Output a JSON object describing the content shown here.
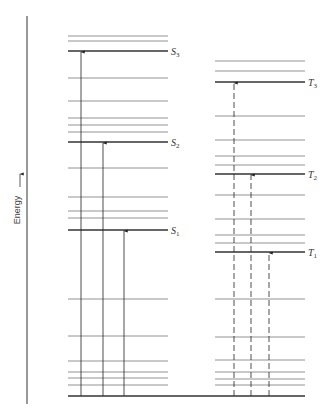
{
  "axis": {
    "label": "Energy",
    "direction": "up",
    "x": 27,
    "y_top": 16,
    "y_bottom": 404
  },
  "ground_state": {
    "y": 396,
    "x1": 68,
    "x2": 305
  },
  "singlet": {
    "x1": 68,
    "x2": 168,
    "levels_minor": [
      36,
      41,
      78,
      101,
      118,
      125,
      132,
      168,
      197,
      211,
      218,
      299,
      336,
      361,
      372,
      378,
      385
    ],
    "levels_major": [
      {
        "name": "S",
        "sub": "3",
        "y": 51
      },
      {
        "name": "S",
        "sub": "2",
        "y": 142
      },
      {
        "name": "S",
        "sub": "1",
        "y": 230
      }
    ],
    "arrows": [
      {
        "x": 81,
        "to_y": 51,
        "style": "solid"
      },
      {
        "x": 103,
        "to_y": 142,
        "style": "solid"
      },
      {
        "x": 124,
        "to_y": 230,
        "style": "solid"
      }
    ]
  },
  "triplet": {
    "x1": 215,
    "x2": 305,
    "levels_minor": [
      61,
      71,
      116,
      140,
      156,
      165,
      195,
      219,
      235,
      243,
      299,
      337,
      360,
      372,
      379,
      385
    ],
    "levels_major": [
      {
        "name": "T",
        "sub": "3",
        "y": 82
      },
      {
        "name": "T",
        "sub": "2",
        "y": 174
      },
      {
        "name": "T",
        "sub": "1",
        "y": 252
      }
    ],
    "arrows": [
      {
        "x": 234,
        "to_y": 82,
        "style": "dashed"
      },
      {
        "x": 251,
        "to_y": 174,
        "style": "dashed"
      },
      {
        "x": 269,
        "to_y": 252,
        "style": "dashed"
      }
    ]
  },
  "colors": {
    "line": "#333333",
    "minor": "#777777",
    "text": "#333333"
  }
}
